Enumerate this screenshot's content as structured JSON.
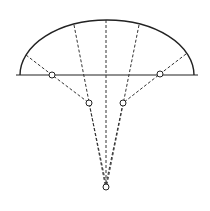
{
  "diagram": {
    "type": "geometric-construction",
    "colors": {
      "ink": "#222222",
      "background": "#ffffff"
    },
    "baseline": {
      "x1": 16,
      "y1": 75,
      "x2": 198,
      "y2": 75
    },
    "arc": {
      "start": [
        20,
        75
      ],
      "control_top": [
        106,
        20
      ],
      "end": [
        194,
        75
      ]
    },
    "apex": {
      "x": 106,
      "y": 187,
      "r": 3
    },
    "nodes": [
      {
        "id": "left-baseline-node",
        "x": 52,
        "y": 75,
        "r": 3
      },
      {
        "id": "right-baseline-node",
        "x": 160,
        "y": 74,
        "r": 3
      },
      {
        "id": "left-inner-node",
        "x": 89,
        "y": 103,
        "r": 3
      },
      {
        "id": "right-inner-node",
        "x": 123,
        "y": 103,
        "r": 3
      }
    ],
    "dashed_lines": [
      {
        "id": "center-ray",
        "points": [
          [
            106,
            20
          ],
          [
            106,
            184
          ]
        ]
      },
      {
        "id": "left-inner-ray",
        "points": [
          [
            74,
            25
          ],
          [
            105,
            184
          ]
        ]
      },
      {
        "id": "right-inner-ray",
        "points": [
          [
            139,
            25
          ],
          [
            107,
            184
          ]
        ]
      },
      {
        "id": "left-outer-ray",
        "points": [
          [
            26,
            55
          ],
          [
            52,
            75
          ],
          [
            89,
            103
          ],
          [
            106,
            184
          ]
        ]
      },
      {
        "id": "right-outer-ray",
        "points": [
          [
            186,
            54
          ],
          [
            160,
            74
          ],
          [
            123,
            103
          ],
          [
            106,
            184
          ]
        ]
      }
    ]
  }
}
